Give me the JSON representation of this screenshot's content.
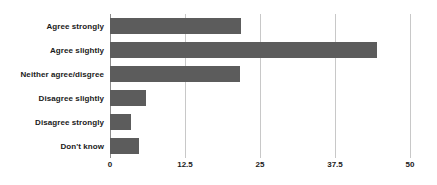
{
  "chart_data": {
    "type": "bar",
    "orientation": "horizontal",
    "title": "",
    "subtitle": "",
    "xlabel": "",
    "ylabel": "",
    "categories": [
      "Agree strongly",
      "Agree slightly",
      "Neither agree/disgree",
      "Disagree slightly",
      "Disagree strongly",
      "Don't know"
    ],
    "values": [
      21.8,
      44.5,
      21.6,
      6.0,
      3.5,
      4.8
    ],
    "xlim": [
      0,
      50
    ],
    "xticks": [
      0,
      12.5,
      25,
      37.5,
      50
    ],
    "xtick_labels": [
      "0",
      "12.5",
      "25",
      "37.5",
      "50"
    ],
    "grid": "vertical",
    "legend": "none",
    "bar_color": "#5c5c5c",
    "gridline_color": "#c8c8c8",
    "axis_color": "#8c8c8c",
    "background_color": "#ffffff",
    "text_color": "#1a1a1a"
  }
}
